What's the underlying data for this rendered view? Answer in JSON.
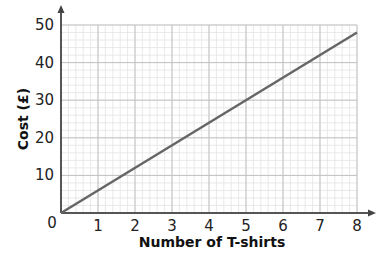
{
  "chart_data": {
    "type": "line",
    "title": "",
    "xlabel": "Number of T-shirts",
    "ylabel": "Cost (£)",
    "x": [
      0,
      8
    ],
    "series": [
      {
        "name": "Cost",
        "values": [
          0,
          48
        ]
      }
    ],
    "xlim": [
      0,
      8
    ],
    "ylim": [
      0,
      50
    ],
    "x_ticks": [
      "1",
      "2",
      "3",
      "4",
      "5",
      "6",
      "7",
      "8"
    ],
    "y_ticks": [
      "10",
      "20",
      "30",
      "40",
      "50"
    ],
    "origin_label": "0",
    "grid": true,
    "legend": "none",
    "line_color": "#666666"
  }
}
